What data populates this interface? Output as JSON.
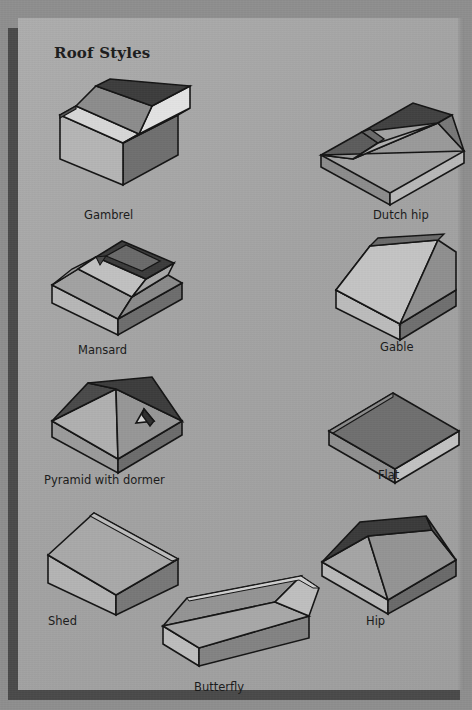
{
  "page": {
    "title": "Roof Styles",
    "background_color": "#8e8e8e",
    "card_color": "#a6a6a6",
    "shadow_color": "#4a4a4a",
    "ink_color": "#1a1a1a"
  },
  "palette": {
    "outline": "#141414",
    "face_dark": "#3a3a3a",
    "face_mid_dark": "#6e6e6e",
    "face_mid": "#8f8f8f",
    "face_light": "#c9c9c9",
    "face_lightest": "#e6e6e6",
    "wall_light": "#b9b9b9",
    "wall_shadow": "#7d7d7d"
  },
  "figures": [
    {
      "id": "gambrel",
      "label": "Gambrel",
      "column": "left",
      "row": 1,
      "description": "Two-slope-per-side barn roof on a rectangular house volume"
    },
    {
      "id": "dutch-hip",
      "label": "Dutch hip",
      "column": "right",
      "row": 1,
      "description": "Hipped roof with a small gablet at the ridge end"
    },
    {
      "id": "mansard",
      "label": "Mansard",
      "column": "left",
      "row": 2,
      "description": "Steep lower slopes on all four sides with a shallow deck on top"
    },
    {
      "id": "gable",
      "label": "Gable",
      "column": "right",
      "row": 2,
      "description": "Simple two-sided ridged roof with triangular end wall"
    },
    {
      "id": "pyramid-with-dormer",
      "label": "Pyramid with dormer",
      "column": "left",
      "row": 3,
      "description": "Four equal slopes meeting at a point, with a small triangular dormer"
    },
    {
      "id": "flat",
      "label": "Flat",
      "column": "right",
      "row": 3,
      "description": "Level roof deck with shallow parapet edge"
    },
    {
      "id": "shed",
      "label": "Shed",
      "column": "left",
      "row": 4,
      "description": "Single plane sloping in one direction"
    },
    {
      "id": "hip",
      "label": "Hip",
      "column": "right",
      "row": 4,
      "description": "Four sloping sides meeting at a central ridge"
    },
    {
      "id": "butterfly",
      "label": "Butterfly",
      "column": "center",
      "row": 5,
      "description": "Two planes sloping inward to a central valley"
    }
  ]
}
